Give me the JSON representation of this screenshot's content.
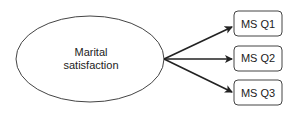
{
  "diagram": {
    "latent": {
      "line1": "Marital",
      "line2": "satisfaction"
    },
    "indicators": [
      {
        "label": "MS Q1"
      },
      {
        "label": "MS Q2"
      },
      {
        "label": "MS Q3"
      }
    ],
    "colors": {
      "stroke": "#333333",
      "text": "#222222",
      "background": "#ffffff"
    }
  }
}
